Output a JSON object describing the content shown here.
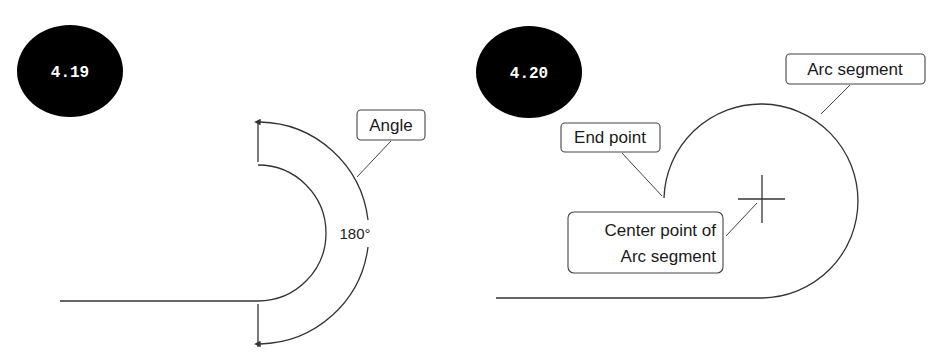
{
  "figures": [
    {
      "id_label": "4.19",
      "callouts": [
        {
          "text": "Angle"
        }
      ],
      "dimension_text": "180°"
    },
    {
      "id_label": "4.20",
      "callouts": [
        {
          "text": "Arc segment"
        },
        {
          "text": "End point"
        },
        {
          "text_lines": [
            "Center point of",
            "Arc segment"
          ]
        }
      ]
    }
  ],
  "colors": {
    "badge_fill": "#000000",
    "badge_text": "#ffffff",
    "line": "#333333",
    "background": "#ffffff"
  }
}
